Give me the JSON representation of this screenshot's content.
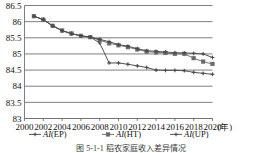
{
  "chart_data": {
    "type": "line",
    "title": "",
    "xlabel": "(年)",
    "ylabel": "",
    "xlim": [
      2000,
      2020
    ],
    "ylim": [
      83,
      86.5
    ],
    "grid": true,
    "legend_position": "bottom",
    "x": [
      2001,
      2002,
      2003,
      2004,
      2005,
      2006,
      2007,
      2008,
      2009,
      2010,
      2011,
      2012,
      2013,
      2014,
      2015,
      2016,
      2017,
      2018,
      2019,
      2020
    ],
    "xticks": [
      "2000",
      "2002",
      "2004",
      "2006",
      "2008",
      "2010",
      "2012",
      "2014",
      "2016",
      "2018",
      "2020"
    ],
    "yticks": [
      "83",
      "83.5",
      "84",
      "84.5",
      "85",
      "85.5",
      "86",
      "86.5"
    ],
    "series": [
      {
        "name": "AI(EP)",
        "name_italic": "AI",
        "name_rest": "(EP)",
        "marker": "cross",
        "color": "#4a4a4a",
        "values": [
          86.17,
          86.06,
          85.87,
          85.72,
          85.63,
          85.56,
          85.52,
          85.34,
          84.72,
          84.72,
          84.68,
          84.63,
          84.58,
          84.5,
          84.49,
          84.49,
          84.48,
          84.43,
          84.4,
          84.37
        ]
      },
      {
        "name": "AI(HT)",
        "name_italic": "AI",
        "name_rest": "(HT)",
        "marker": "square",
        "color": "#6b6b6b",
        "values": [
          86.17,
          86.06,
          85.87,
          85.72,
          85.63,
          85.56,
          85.52,
          85.43,
          85.33,
          85.27,
          85.21,
          85.14,
          85.07,
          85.05,
          85.03,
          85.0,
          85.0,
          84.87,
          84.76,
          84.69
        ]
      },
      {
        "name": "AI(UP)",
        "name_italic": "AI",
        "name_rest": "(UP)",
        "marker": "cross",
        "color": "#4a4a4a",
        "values": [
          86.17,
          86.06,
          85.87,
          85.72,
          85.63,
          85.56,
          85.52,
          85.45,
          85.38,
          85.29,
          85.24,
          85.16,
          85.1,
          85.08,
          85.06,
          85.04,
          85.03,
          85.02,
          85.0,
          84.89
        ]
      }
    ]
  },
  "caption": "图 5-1-1 稻农家庭收入差异情况"
}
